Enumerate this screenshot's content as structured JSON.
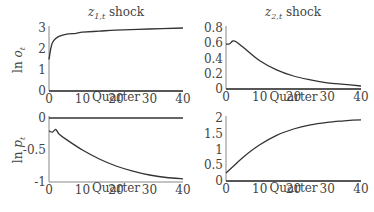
{
  "chart_data": [
    {
      "type": "line",
      "title": "z_{1,t} shock",
      "xlabel": "Quarter",
      "ylabel": "ln o_t",
      "xlim": [
        0,
        40
      ],
      "ylim": [
        0,
        3
      ],
      "xticks": [
        "0",
        "10",
        "20",
        "30",
        "40"
      ],
      "yticks": [
        "0",
        "1",
        "2",
        "3"
      ],
      "series": [
        {
          "name": "response",
          "x": [
            0,
            0.5,
            1,
            2,
            3,
            5,
            8,
            10,
            15,
            20,
            30,
            40
          ],
          "values": [
            1.5,
            2.0,
            2.3,
            2.5,
            2.6,
            2.7,
            2.75,
            2.8,
            2.85,
            2.9,
            2.95,
            3.0
          ]
        },
        {
          "name": "zero",
          "x": [
            0,
            40
          ],
          "values": [
            0,
            0
          ]
        }
      ]
    },
    {
      "type": "line",
      "title": "z_{2,t} shock",
      "xlabel": "Quarter",
      "ylabel": "",
      "xlim": [
        0,
        40
      ],
      "ylim": [
        0,
        0.8
      ],
      "xticks": [
        "0",
        "10",
        "20",
        "30",
        "40"
      ],
      "yticks": [
        "0",
        "0.2",
        "0.4",
        "0.6",
        "0.8"
      ],
      "series": [
        {
          "name": "response",
          "x": [
            0,
            1,
            2,
            3,
            5,
            10,
            15,
            20,
            25,
            30,
            35,
            40
          ],
          "values": [
            0.59,
            0.59,
            0.63,
            0.62,
            0.55,
            0.37,
            0.25,
            0.17,
            0.12,
            0.08,
            0.06,
            0.04
          ]
        },
        {
          "name": "zero",
          "x": [
            0,
            40
          ],
          "values": [
            0,
            0
          ]
        }
      ]
    },
    {
      "type": "line",
      "title": "",
      "xlabel": "Quarter",
      "ylabel": "ln p_t",
      "xlim": [
        0,
        40
      ],
      "ylim": [
        -1,
        0
      ],
      "xticks": [
        "0",
        "10",
        "20",
        "30",
        "40"
      ],
      "yticks": [
        "-1",
        "-0.5",
        "0"
      ],
      "series": [
        {
          "name": "response",
          "x": [
            0,
            1,
            2,
            3,
            5,
            10,
            15,
            20,
            25,
            30,
            35,
            40
          ],
          "values": [
            -0.2,
            -0.22,
            -0.18,
            -0.25,
            -0.33,
            -0.5,
            -0.64,
            -0.75,
            -0.83,
            -0.89,
            -0.93,
            -0.95
          ]
        },
        {
          "name": "zero",
          "x": [
            0,
            40
          ],
          "values": [
            0,
            0
          ]
        }
      ]
    },
    {
      "type": "line",
      "title": "",
      "xlabel": "Quarter",
      "ylabel": "",
      "xlim": [
        0,
        40
      ],
      "ylim": [
        0,
        2
      ],
      "xticks": [
        "0",
        "10",
        "20",
        "30",
        "40"
      ],
      "yticks": [
        "0",
        "0.5",
        "1",
        "1.5",
        "2"
      ],
      "series": [
        {
          "name": "response",
          "x": [
            0,
            2,
            5,
            10,
            15,
            20,
            25,
            30,
            35,
            40
          ],
          "values": [
            0.25,
            0.45,
            0.75,
            1.15,
            1.45,
            1.65,
            1.78,
            1.86,
            1.91,
            1.94
          ]
        },
        {
          "name": "zero",
          "x": [
            0,
            40
          ],
          "values": [
            0,
            0
          ]
        }
      ]
    }
  ],
  "panels": {
    "tl": {
      "title_main": "z",
      "title_sub": "1,t",
      "title_suffix": " shock",
      "ylabel_main": "ln ",
      "ylabel_var": "o",
      "ylabel_sub": "t"
    },
    "tr": {
      "title_main": "z",
      "title_sub": "2,t",
      "title_suffix": " shock"
    },
    "bl": {
      "ylabel_main": "ln ",
      "ylabel_var": "p",
      "ylabel_sub": "t"
    },
    "xlabel": "Quarter"
  }
}
